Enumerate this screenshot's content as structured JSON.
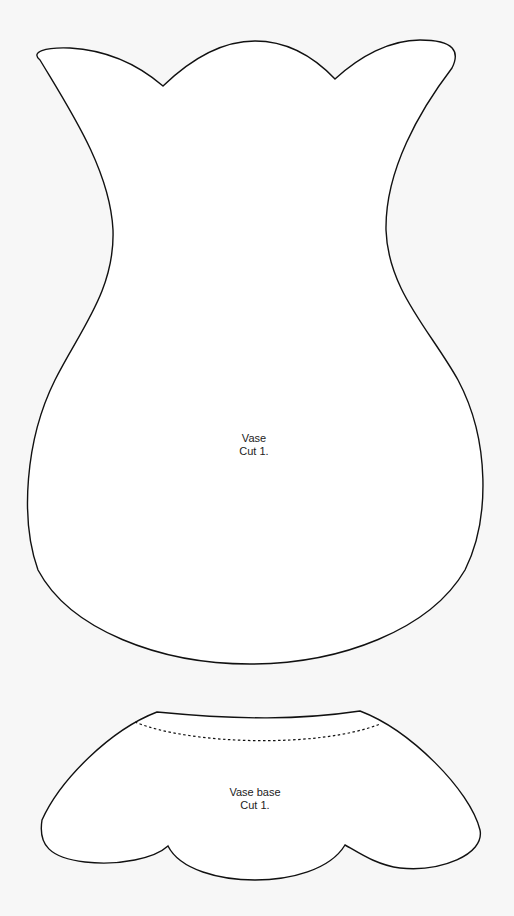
{
  "pieces": [
    {
      "name": "Vase",
      "instruction": "Cut 1."
    },
    {
      "name": "Vase base",
      "instruction": "Cut 1."
    }
  ],
  "colors": {
    "background": "#f7f7f7",
    "outline": "#111111",
    "text": "#222222"
  }
}
